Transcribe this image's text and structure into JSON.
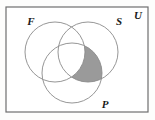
{
  "figure": {
    "name": "venn-diagram-three-set",
    "canvas": {
      "width": 155,
      "height": 120
    },
    "background_color": "#fdfdfc"
  },
  "universe": {
    "label": "U",
    "label_x": 138,
    "label_y": 16,
    "frame": {
      "x": 6,
      "y": 7,
      "width": 142,
      "height": 105
    },
    "frame_color": "#6e6e6e",
    "frame_width": 1.2,
    "frame_fill": "#ffffff"
  },
  "sets": [
    {
      "id": "F",
      "label": "F",
      "cx": 55,
      "cy": 52,
      "r": 30,
      "label_x": 31,
      "label_y": 22,
      "stroke": "#8a8a8a",
      "stroke_width": 0.9,
      "fill": "none"
    },
    {
      "id": "S",
      "label": "S",
      "cx": 88,
      "cy": 52,
      "r": 30,
      "label_x": 119,
      "label_y": 22,
      "stroke": "#8a8a8a",
      "stroke_width": 0.9,
      "fill": "none"
    },
    {
      "id": "P",
      "label": "P",
      "cx": 72,
      "cy": 73,
      "r": 30,
      "label_x": 105,
      "label_y": 105,
      "stroke": "#8a8a8a",
      "stroke_width": 0.9,
      "fill": "none"
    }
  ],
  "shaded_region": {
    "name": "S-intersect-P-minus-F",
    "expression": "(S ∩ P) − F",
    "fill_color": "#9a9a9a",
    "opacity": 1
  },
  "label_font_size": 11
}
